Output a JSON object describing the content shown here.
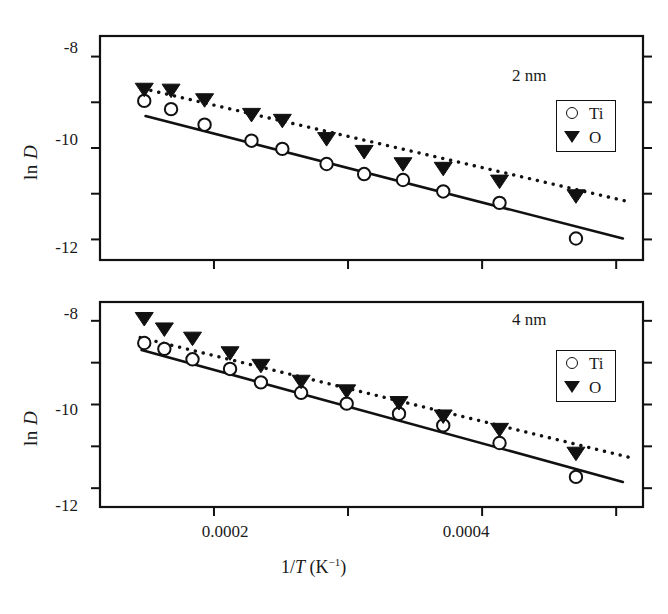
{
  "figure": {
    "axis_y_label": "ln D",
    "axis_x_label_prefix": "1/",
    "axis_x_label_italic": "T",
    "axis_x_label_unit": "(K",
    "axis_x_label_exp": "−1",
    "axis_x_label_close": ")",
    "legend": {
      "ti_label": "Ti",
      "o_label": "O",
      "ti_symbol": "open-circle",
      "o_symbol": "filled-down-triangle"
    },
    "colors": {
      "foreground": "#111111",
      "background": "#ffffff",
      "marker_fill": "#111111",
      "marker_open": "#ffffff"
    },
    "panels": [
      {
        "tag": "2 nm"
      },
      {
        "tag": "4 nm"
      }
    ]
  },
  "chart_data": [
    {
      "type": "scatter",
      "title": "2 nm",
      "xlabel": "1/T (K^-1)",
      "ylabel": "ln D",
      "xlim": [
        0.000115,
        0.00052
      ],
      "ylim": [
        -12.45,
        -7.55
      ],
      "xticks": [
        0.0002,
        0.0003,
        0.0004,
        0.0005
      ],
      "xtick_labels": [
        "0.0002",
        "",
        "0.0004",
        ""
      ],
      "yticks": [
        -8,
        -9,
        -10,
        -11,
        -12
      ],
      "ytick_labels": [
        "-8",
        "",
        "-10",
        "",
        "-12"
      ],
      "grid": false,
      "legend_position": "upper right",
      "series": [
        {
          "name": "Ti",
          "marker": "open-circle",
          "x": [
            0.000148,
            0.000168,
            0.000193,
            0.000228,
            0.000251,
            0.000284,
            0.000312,
            0.000341,
            0.000371,
            0.000413,
            0.00047
          ],
          "y": [
            -8.97,
            -9.15,
            -9.49,
            -9.84,
            -10.02,
            -10.35,
            -10.57,
            -10.7,
            -10.95,
            -11.2,
            -11.98
          ]
        },
        {
          "name": "O",
          "marker": "filled-down-triangle",
          "x": [
            0.000148,
            0.000168,
            0.000193,
            0.000228,
            0.000251,
            0.000284,
            0.000312,
            0.000341,
            0.000371,
            0.000413,
            0.00047
          ],
          "y": [
            -8.72,
            -8.74,
            -8.95,
            -9.27,
            -9.4,
            -9.8,
            -10.08,
            -10.35,
            -10.45,
            -10.73,
            -11.05
          ]
        }
      ],
      "fits": [
        {
          "name": "Ti fit",
          "style": "solid",
          "x": [
            0.000149,
            0.000505
          ],
          "y": [
            -9.3,
            -11.98
          ]
        },
        {
          "name": "O fit",
          "style": "dotted",
          "x": [
            0.000147,
            0.00051
          ],
          "y": [
            -8.7,
            -11.18
          ]
        }
      ]
    },
    {
      "type": "scatter",
      "title": "4 nm",
      "xlabel": "1/T (K^-1)",
      "ylabel": "ln D",
      "xlim": [
        0.000115,
        0.00052
      ],
      "ylim": [
        -12.45,
        -7.55
      ],
      "xticks": [
        0.0002,
        0.0003,
        0.0004,
        0.0005
      ],
      "xtick_labels": [
        "0.0002",
        "",
        "0.0004",
        ""
      ],
      "yticks": [
        -8,
        -9,
        -10,
        -11,
        -12
      ],
      "ytick_labels": [
        "-8",
        "",
        "-10",
        "",
        "-12"
      ],
      "grid": false,
      "legend_position": "upper right",
      "series": [
        {
          "name": "Ti",
          "marker": "open-circle",
          "x": [
            0.000148,
            0.000163,
            0.000184,
            0.000212,
            0.000235,
            0.000265,
            0.000299,
            0.000338,
            0.000371,
            0.000413,
            0.00047
          ],
          "y": [
            -8.53,
            -8.67,
            -8.92,
            -9.15,
            -9.47,
            -9.72,
            -9.98,
            -10.22,
            -10.5,
            -10.92,
            -11.73
          ]
        },
        {
          "name": "O",
          "marker": "filled-down-triangle",
          "x": [
            0.000148,
            0.000163,
            0.000184,
            0.000212,
            0.000235,
            0.000265,
            0.000299,
            0.000338,
            0.000371,
            0.000413,
            0.00047
          ],
          "y": [
            -7.95,
            -8.2,
            -8.42,
            -8.77,
            -9.07,
            -9.45,
            -9.68,
            -9.96,
            -10.28,
            -10.6,
            -11.17
          ]
        }
      ],
      "fits": [
        {
          "name": "Ti fit",
          "style": "solid",
          "x": [
            0.000146,
            0.000505
          ],
          "y": [
            -8.7,
            -11.85
          ]
        },
        {
          "name": "O fit",
          "style": "dotted",
          "x": [
            0.000145,
            0.000512
          ],
          "y": [
            -8.4,
            -11.28
          ]
        }
      ]
    }
  ]
}
